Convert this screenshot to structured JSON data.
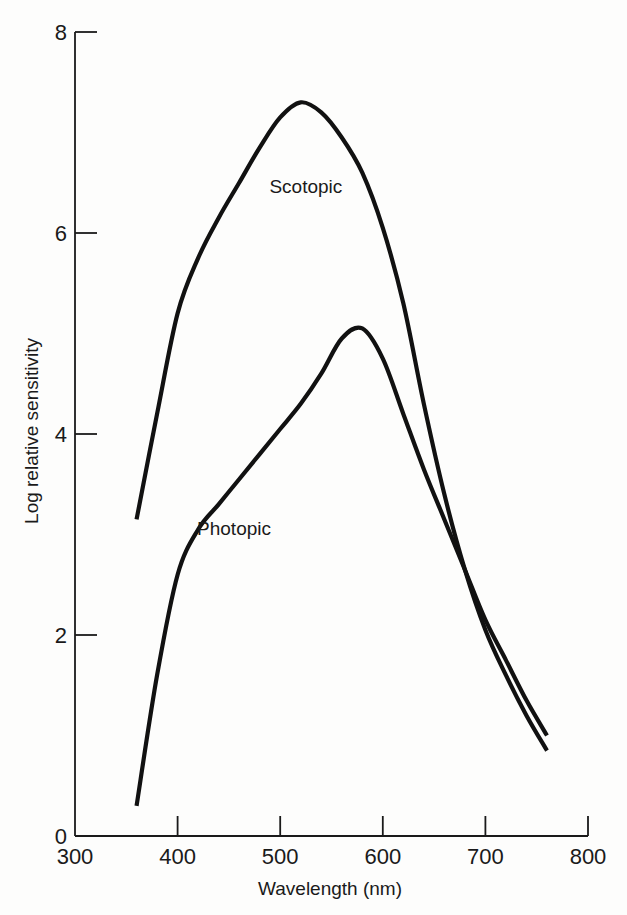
{
  "chart_data": {
    "type": "line",
    "title": "",
    "xlabel": "Wavelength (nm)",
    "ylabel": "Log relative sensitivity",
    "xlim": [
      300,
      800
    ],
    "ylim": [
      0,
      8
    ],
    "xticks": [
      300,
      400,
      500,
      600,
      700,
      800
    ],
    "yticks": [
      0,
      2,
      4,
      6,
      8
    ],
    "grid": false,
    "legend": "inline labels",
    "series": [
      {
        "name": "Scotopic",
        "label_position": {
          "x": 525,
          "y": 6.4
        },
        "x": [
          360,
          380,
          400,
          420,
          440,
          460,
          480,
          500,
          520,
          540,
          560,
          580,
          600,
          620,
          640,
          660,
          680,
          700,
          720,
          740,
          760
        ],
        "y": [
          3.15,
          4.2,
          5.2,
          5.75,
          6.15,
          6.5,
          6.85,
          7.15,
          7.3,
          7.2,
          6.95,
          6.6,
          6.05,
          5.3,
          4.3,
          3.4,
          2.65,
          2.05,
          1.6,
          1.2,
          0.85
        ]
      },
      {
        "name": "Photopic",
        "label_position": {
          "x": 455,
          "y": 3.0
        },
        "x": [
          360,
          380,
          400,
          420,
          440,
          460,
          480,
          500,
          520,
          540,
          560,
          580,
          600,
          620,
          640,
          660,
          680,
          700,
          720,
          740,
          760
        ],
        "y": [
          0.3,
          1.6,
          2.6,
          3.05,
          3.3,
          3.55,
          3.8,
          4.05,
          4.3,
          4.6,
          4.95,
          5.05,
          4.75,
          4.2,
          3.65,
          3.15,
          2.65,
          2.15,
          1.75,
          1.35,
          1.0
        ]
      }
    ]
  }
}
